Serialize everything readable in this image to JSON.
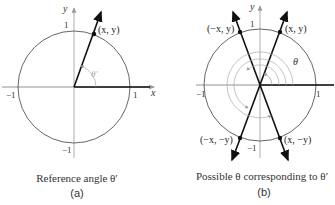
{
  "panel_a": {
    "axis_x": "x",
    "axis_y": "y",
    "tick_pos_x": "1",
    "tick_neg_x": "−1",
    "tick_pos_y": "1",
    "tick_neg_y": "−1",
    "point": "(x, y)",
    "angle": "θ′",
    "caption": "Reference angle θ′",
    "label": "(a)"
  },
  "panel_b": {
    "axis_y": "y",
    "tick_pos_x": "1",
    "tick_neg_x": "−1",
    "tick_pos_y": "1",
    "tick_neg_y": "−1",
    "point_q1": "(x, y)",
    "point_q2": "(−x, y)",
    "point_q3": "(−x, −y)",
    "point_q4": "(x, −y)",
    "angle": "θ",
    "caption": "Possible θ corresponding to θ′",
    "label": "(b)"
  },
  "colors": {
    "circle": "#555555",
    "axis": "#777777",
    "ray": "#111111",
    "arc": "#aaaaaa"
  }
}
